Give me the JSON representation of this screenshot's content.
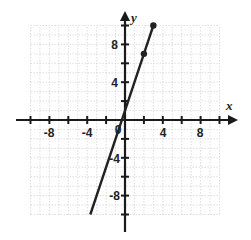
{
  "chart_data": {
    "type": "line",
    "title": "",
    "xlabel": "x",
    "ylabel": "y",
    "xlim": [
      -10,
      10
    ],
    "ylim": [
      -10,
      10
    ],
    "grid": true,
    "x_ticks": [
      -8,
      -4,
      4,
      8
    ],
    "y_ticks": [
      8,
      4,
      -4,
      -8
    ],
    "origin_label": "0",
    "series": [
      {
        "name": "y = 3x + 1",
        "equation": "y = 3x + 1",
        "x": [
          -3.67,
          0,
          2,
          3
        ],
        "y": [
          -10,
          1,
          7,
          10
        ],
        "marked_points": [
          [
            2,
            7
          ],
          [
            3,
            10
          ]
        ],
        "color": "#222222"
      }
    ]
  },
  "labels": {
    "x_axis": "x",
    "y_axis": "y",
    "origin": "0",
    "xt_m8": "-8",
    "xt_m4": "-4",
    "xt_4": "4",
    "xt_8": "8",
    "yt_8": "8",
    "yt_4": "4",
    "yt_m4": "-4",
    "yt_m8": "-8"
  }
}
